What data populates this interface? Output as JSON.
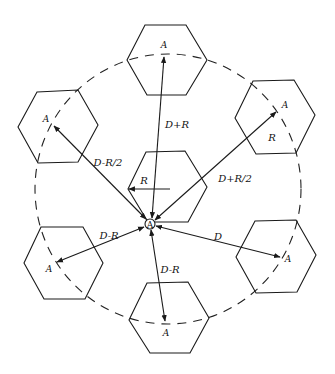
{
  "diagram": {
    "colors": {
      "stroke": "#1a1a1a",
      "background": "#ffffff"
    },
    "center_cell": {
      "label": "A",
      "radius_label": "R"
    },
    "co_channel_cells": [
      {
        "position": "top",
        "label": "A"
      },
      {
        "position": "upper-right",
        "label": "A",
        "inner_label": "R"
      },
      {
        "position": "lower-right",
        "label": "A"
      },
      {
        "position": "bottom",
        "label": "A"
      },
      {
        "position": "lower-left",
        "label": "A"
      },
      {
        "position": "upper-left",
        "label": "A"
      }
    ],
    "distances": [
      {
        "to": "top",
        "label": "D+R"
      },
      {
        "to": "upper-right",
        "label": "D+R/2"
      },
      {
        "to": "lower-right",
        "label": "D"
      },
      {
        "to": "bottom",
        "label": "D-R"
      },
      {
        "to": "lower-left",
        "label": "D-R"
      },
      {
        "to": "upper-left",
        "label": "D-R/2"
      }
    ]
  }
}
